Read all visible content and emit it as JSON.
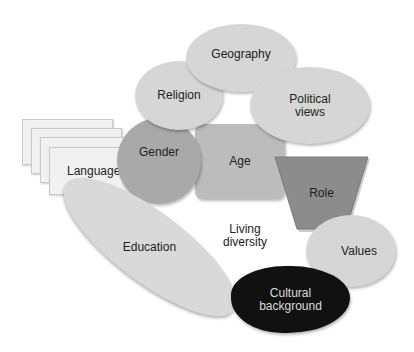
{
  "diagram": {
    "center_label": "Living\ndiversity",
    "center_label_lines": [
      "Living",
      "diversity"
    ],
    "nodes": {
      "geography": {
        "label": "Geography",
        "color": "#d6d6d6"
      },
      "religion": {
        "label": "Religion",
        "color": "#d6d6d6"
      },
      "political_views": {
        "label_lines": [
          "Political",
          "views"
        ],
        "color": "#d6d6d6"
      },
      "language": {
        "label": "Language",
        "color": "#f1f1f1"
      },
      "gender": {
        "label": "Gender",
        "color": "#a9a9a9"
      },
      "age": {
        "label": "Age",
        "color": "#bcbcbc"
      },
      "role": {
        "label": "Role",
        "color": "#8c8c8c"
      },
      "education": {
        "label": "Education",
        "color": "#d9d9d9"
      },
      "values": {
        "label": "Values",
        "color": "#d6d6d6"
      },
      "cultural_background": {
        "label_lines": [
          "Cultural",
          "background"
        ],
        "color": "#111111",
        "text_color": "#dddddd"
      }
    }
  }
}
